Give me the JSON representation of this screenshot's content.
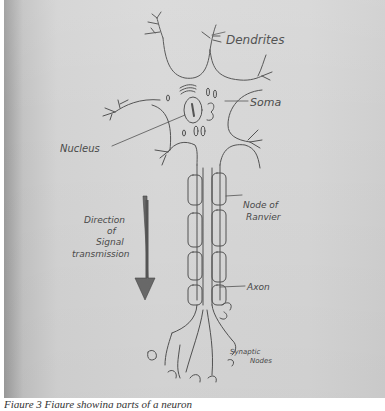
{
  "figure": {
    "caption": "Figure 3 Figure showing parts of a neuron",
    "medium": "pencil sketch on paper",
    "labels": {
      "dendrites": "Dendrites",
      "soma": "Soma",
      "nucleus": "Nucleus",
      "node_of_ranvier": [
        "Node of",
        "Ranvier"
      ],
      "direction": [
        "Direction",
        "of",
        "Signal",
        "transmission"
      ],
      "axon": "Axon",
      "synaptic_nodes": [
        "Synaptic",
        "Nodes"
      ]
    },
    "colors": {
      "paper": "#d6d6d6",
      "pencil": "#3c3c3c",
      "arrow": "#5e5e5e"
    }
  }
}
